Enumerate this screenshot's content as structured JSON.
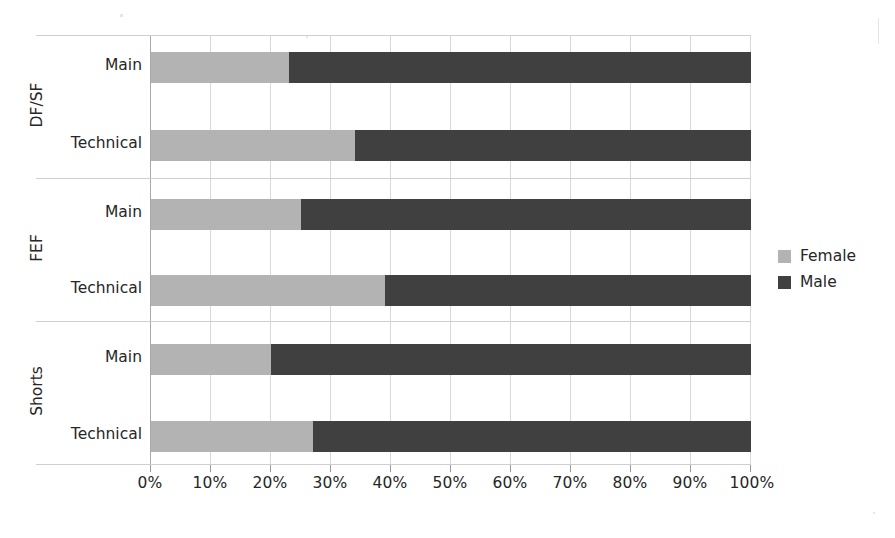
{
  "chart_data": {
    "type": "bar",
    "subtype": "100% stacked horizontal bar",
    "title": "",
    "xlabel": "",
    "ylabel": "",
    "xlim": [
      0,
      100
    ],
    "xtick_labels": [
      "0%",
      "10%",
      "20%",
      "30%",
      "40%",
      "50%",
      "60%",
      "70%",
      "80%",
      "90%",
      "100%"
    ],
    "xticks": [
      0,
      10,
      20,
      30,
      40,
      50,
      60,
      70,
      80,
      90,
      100
    ],
    "grid": true,
    "legend_position": "right",
    "legend": [
      "Female",
      "Male"
    ],
    "colors": {
      "Female": "#b3b3b3",
      "Male": "#404040"
    },
    "groups": [
      {
        "name": "DF/SF",
        "categories": [
          "Main",
          "Technical"
        ],
        "rows": [
          {
            "category": "Main",
            "Female": 23,
            "Male": 77
          },
          {
            "category": "Technical",
            "Female": 34,
            "Male": 66
          }
        ]
      },
      {
        "name": "FEF",
        "categories": [
          "Main",
          "Technical"
        ],
        "rows": [
          {
            "category": "Main",
            "Female": 25,
            "Male": 75
          },
          {
            "category": "Technical",
            "Female": 39,
            "Male": 61
          }
        ]
      },
      {
        "name": "Shorts",
        "categories": [
          "Main",
          "Technical"
        ],
        "rows": [
          {
            "category": "Main",
            "Female": 20,
            "Male": 80
          },
          {
            "category": "Technical",
            "Female": 27,
            "Male": 73
          }
        ]
      }
    ],
    "series": [
      {
        "name": "Female",
        "values": [
          23,
          34,
          25,
          39,
          20,
          27
        ]
      },
      {
        "name": "Male",
        "values": [
          77,
          66,
          75,
          61,
          80,
          73
        ]
      }
    ],
    "categories": [
      "DF/SF - Main",
      "DF/SF - Technical",
      "FEF - Main",
      "FEF - Technical",
      "Shorts - Main",
      "Shorts - Technical"
    ]
  },
  "axis": {
    "x_tick_0": "0%",
    "x_tick_1": "10%",
    "x_tick_2": "20%",
    "x_tick_3": "30%",
    "x_tick_4": "40%",
    "x_tick_5": "50%",
    "x_tick_6": "60%",
    "x_tick_7": "70%",
    "x_tick_8": "80%",
    "x_tick_9": "90%",
    "x_tick_10": "100%"
  },
  "category_labels": {
    "dfsf_main": "Main",
    "dfsf_technical": "Technical",
    "fef_main": "Main",
    "fef_technical": "Technical",
    "shorts_main": "Main",
    "shorts_technical": "Technical"
  },
  "group_labels": {
    "dfsf": "DF/SF",
    "fef": "FEF",
    "shorts": "Shorts"
  },
  "legend": {
    "female_label": "Female",
    "male_label": "Male"
  }
}
